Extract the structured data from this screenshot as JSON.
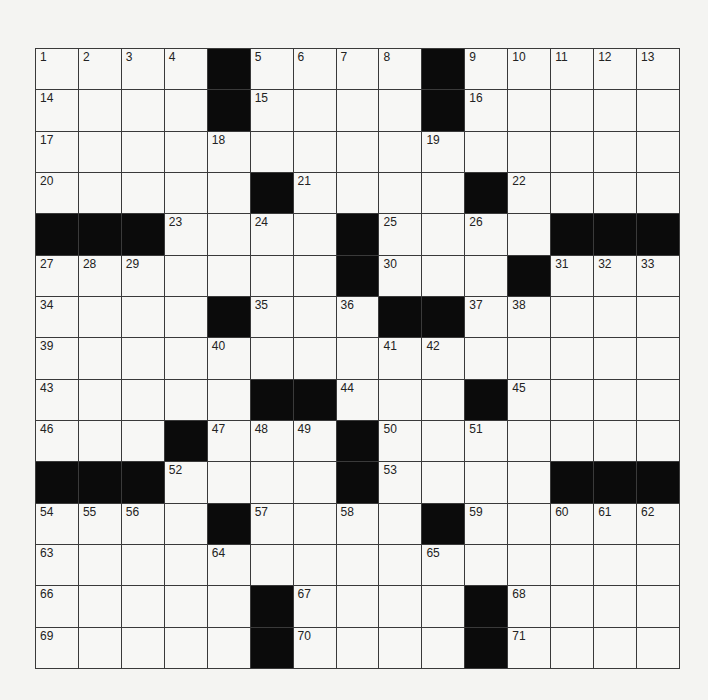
{
  "puzzle": {
    "rows": 15,
    "cols": 15,
    "colors": {
      "block": "#0b0b0b",
      "cell": "#f7f7f5",
      "line": "#3a3a3a",
      "background": "#f4f4f2"
    },
    "grid": [
      [
        "1",
        "2",
        "3",
        "4",
        "#",
        "5",
        "6",
        "7",
        "8",
        "#",
        "9",
        "10",
        "11",
        "12",
        "13"
      ],
      [
        "14",
        "",
        "",
        "",
        "#",
        "15",
        "",
        "",
        "",
        "#",
        "16",
        "",
        "",
        "",
        ""
      ],
      [
        "17",
        "",
        "",
        "",
        "18",
        "",
        "",
        "",
        "",
        "19",
        "",
        "",
        "",
        "",
        ""
      ],
      [
        "20",
        "",
        "",
        "",
        "",
        "#",
        "21",
        "",
        "",
        "",
        "#",
        "22",
        "",
        "",
        ""
      ],
      [
        "#",
        "#",
        "#",
        "23",
        "",
        "24",
        "",
        "#",
        "25",
        "",
        "26",
        "",
        "#",
        "#",
        "#"
      ],
      [
        "27",
        "28",
        "29",
        "",
        "",
        "",
        "",
        "#",
        "30",
        "",
        "",
        "#",
        "31",
        "32",
        "33"
      ],
      [
        "34",
        "",
        "",
        "",
        "#",
        "35",
        "",
        "36",
        "#",
        "#",
        "37",
        "38",
        "",
        "",
        ""
      ],
      [
        "39",
        "",
        "",
        "",
        "40",
        "",
        "",
        "",
        "41",
        "42",
        "",
        "",
        "",
        "",
        ""
      ],
      [
        "43",
        "",
        "",
        "",
        "",
        "#",
        "#",
        "44",
        "",
        "",
        "#",
        "45",
        "",
        "",
        ""
      ],
      [
        "46",
        "",
        "",
        "#",
        "47",
        "48",
        "49",
        "#",
        "50",
        "",
        "51",
        "",
        "",
        "",
        ""
      ],
      [
        "#",
        "#",
        "#",
        "52",
        "",
        "",
        "",
        "#",
        "53",
        "",
        "",
        "",
        "#",
        "#",
        "#"
      ],
      [
        "54",
        "55",
        "56",
        "",
        "#",
        "57",
        "",
        "58",
        "",
        "#",
        "59",
        "",
        "60",
        "61",
        "62"
      ],
      [
        "63",
        "",
        "",
        "",
        "64",
        "",
        "",
        "",
        "",
        "65",
        "",
        "",
        "",
        "",
        ""
      ],
      [
        "66",
        "",
        "",
        "",
        "",
        "#",
        "67",
        "",
        "",
        "",
        "#",
        "68",
        "",
        "",
        ""
      ],
      [
        "69",
        "",
        "",
        "",
        "",
        "#",
        "70",
        "",
        "",
        "",
        "#",
        "71",
        "",
        "",
        ""
      ]
    ]
  }
}
